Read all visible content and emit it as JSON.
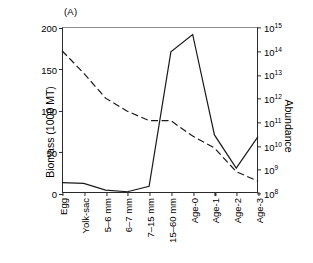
{
  "panel": {
    "label": "(A)"
  },
  "axes": {
    "left": {
      "title": "Biomass (1000 MT)",
      "ticks": [
        "0",
        "50",
        "100",
        "150",
        "200"
      ],
      "min": 0,
      "max": 200
    },
    "right": {
      "title": "Abundance",
      "ticks": [
        "10",
        "10",
        "10",
        "10",
        "10",
        "10",
        "10",
        "10"
      ],
      "exponents": [
        "8",
        "9",
        "10",
        "11",
        "12",
        "13",
        "14",
        "15"
      ],
      "min": 8,
      "max": 15
    },
    "bottom": {
      "categories": [
        "Egg",
        "Yolk-sac",
        "5–6 mm",
        "6–7 mm",
        "7–15 mm",
        "15–60 mm",
        "Age-0",
        "Age-1",
        "Age-2",
        "Age-3"
      ]
    }
  },
  "style": {
    "biomass_color": "#1a1a1a",
    "abundance_color": "#1a1a1a",
    "frame_color": "#2a2a2a"
  },
  "chart_data": {
    "type": "line",
    "title": "(A)",
    "xlabel": "",
    "ylabel": "Biomass (1000 MT)",
    "y2label": "Abundance",
    "grid": false,
    "legend": null,
    "categories": [
      "Egg",
      "Yolk-sac",
      "5–6 mm",
      "6–7 mm",
      "7–15 mm",
      "15–60 mm",
      "Age-0",
      "Age-1",
      "Age-2",
      "Age-3"
    ],
    "ylim": [
      0,
      200
    ],
    "y2lim_log10": [
      8,
      15
    ],
    "yticks": [
      0,
      50,
      100,
      150,
      200
    ],
    "y2ticks_log10": [
      8,
      9,
      10,
      11,
      12,
      13,
      14,
      15
    ],
    "series": [
      {
        "name": "Biomass",
        "axis": "left",
        "linestyle": "solid",
        "units": "1000 MT",
        "values": [
          12.5,
          11.5,
          3.5,
          1.5,
          8.0,
          170.0,
          191.0,
          70.0,
          30.0,
          68.0
        ]
      },
      {
        "name": "Abundance",
        "axis": "right",
        "linestyle": "dashed",
        "units": "count",
        "values_log10": [
          14.0,
          13.05,
          12.0,
          11.45,
          11.05,
          11.05,
          10.4,
          9.9,
          8.9,
          8.5
        ],
        "values": [
          100000000000000.0,
          11000000000000.0,
          1000000000000.0,
          280000000000.0,
          110000000000.0,
          110000000000.0,
          25000000000.0,
          8000000000.0,
          800000000.0,
          320000000.0
        ]
      }
    ]
  }
}
